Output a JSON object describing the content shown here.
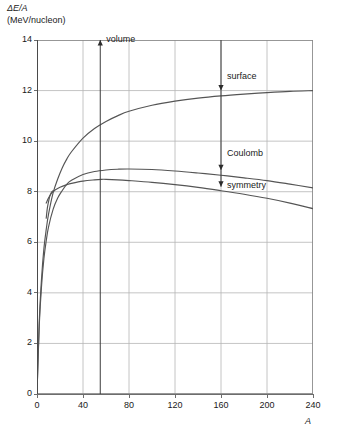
{
  "chart_data": {
    "type": "line",
    "title": "",
    "ylabel_line1": "ΔE/A",
    "ylabel_line2": "(MeV/nucleon)",
    "xlabel": "A",
    "xlim": [
      0,
      240
    ],
    "ylim": [
      0,
      14
    ],
    "xticks": [
      0,
      40,
      80,
      120,
      160,
      200,
      240
    ],
    "yticks": [
      0,
      2,
      4,
      6,
      8,
      10,
      12,
      14
    ],
    "grid": true,
    "legend": "none",
    "curve_color": "#555555",
    "grid_color": "#b5b5b5",
    "axis_color": "#6d6d6d",
    "series": [
      {
        "name": "volume minus surface",
        "points": [
          [
            0,
            0
          ],
          [
            2,
            2.9
          ],
          [
            4,
            4.6
          ],
          [
            6,
            5.75
          ],
          [
            8,
            6.5
          ],
          [
            10,
            7.1
          ],
          [
            14,
            7.95
          ],
          [
            18,
            8.5
          ],
          [
            22,
            8.95
          ],
          [
            26,
            9.3
          ],
          [
            30,
            9.58
          ],
          [
            40,
            10.12
          ],
          [
            50,
            10.5
          ],
          [
            60,
            10.78
          ],
          [
            70,
            11.0
          ],
          [
            80,
            11.18
          ],
          [
            100,
            11.42
          ],
          [
            120,
            11.58
          ],
          [
            140,
            11.7
          ],
          [
            160,
            11.79
          ],
          [
            180,
            11.86
          ],
          [
            200,
            11.92
          ],
          [
            220,
            11.97
          ],
          [
            240,
            12.0
          ]
        ]
      },
      {
        "name": "volume minus surface minus Coulomb",
        "points": [
          [
            0,
            0
          ],
          [
            2,
            2.75
          ],
          [
            4,
            4.3
          ],
          [
            6,
            5.35
          ],
          [
            8,
            6.05
          ],
          [
            10,
            6.6
          ],
          [
            14,
            7.3
          ],
          [
            18,
            7.75
          ],
          [
            22,
            8.05
          ],
          [
            26,
            8.3
          ],
          [
            30,
            8.45
          ],
          [
            40,
            8.68
          ],
          [
            50,
            8.8
          ],
          [
            60,
            8.86
          ],
          [
            70,
            8.89
          ],
          [
            80,
            8.9
          ],
          [
            100,
            8.88
          ],
          [
            120,
            8.82
          ],
          [
            140,
            8.74
          ],
          [
            160,
            8.65
          ],
          [
            180,
            8.55
          ],
          [
            200,
            8.44
          ],
          [
            220,
            8.3
          ],
          [
            240,
            8.15
          ]
        ]
      },
      {
        "name": "total binding energy per nucleon",
        "points": [
          [
            8,
            7.55
          ],
          [
            10,
            7.75
          ],
          [
            12,
            7.9
          ],
          [
            14,
            8.0
          ],
          [
            16,
            8.08
          ],
          [
            20,
            8.18
          ],
          [
            26,
            8.28
          ],
          [
            30,
            8.33
          ],
          [
            40,
            8.42
          ],
          [
            50,
            8.47
          ],
          [
            56,
            8.49
          ],
          [
            60,
            8.49
          ],
          [
            70,
            8.47
          ],
          [
            80,
            8.44
          ],
          [
            100,
            8.37
          ],
          [
            120,
            8.28
          ],
          [
            140,
            8.17
          ],
          [
            160,
            8.04
          ],
          [
            180,
            7.9
          ],
          [
            200,
            7.74
          ],
          [
            220,
            7.55
          ],
          [
            240,
            7.33
          ]
        ]
      },
      {
        "name": "lower branch near light nuclei",
        "points": [
          [
            8,
            6.95
          ],
          [
            9,
            7.35
          ],
          [
            10,
            7.6
          ],
          [
            11,
            7.8
          ],
          [
            12,
            7.92
          ],
          [
            13,
            8.0
          ],
          [
            14,
            8.04
          ]
        ]
      }
    ],
    "annotations": [
      {
        "label": "volume",
        "x_value": 55,
        "arrow": "up",
        "from_y": 0,
        "to_y": 14
      },
      {
        "label": "surface",
        "x_value": 160,
        "arrow": "down",
        "from_y": 14,
        "to_y": 12.0
      },
      {
        "label": "Coulomb",
        "x_value": 160,
        "arrow": "down",
        "from_y": 12.0,
        "to_y": 8.85
      },
      {
        "label": "symmetry",
        "x_value": 160,
        "arrow": "down",
        "from_y": 8.85,
        "to_y": 8.2
      }
    ]
  }
}
